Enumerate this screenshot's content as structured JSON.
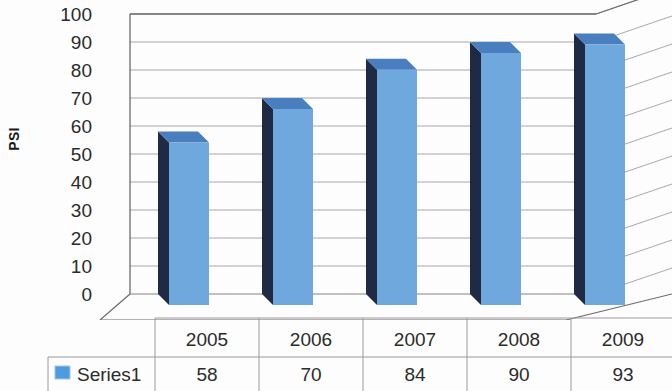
{
  "chart_data": {
    "type": "bar",
    "title": "",
    "subtitle": "",
    "xlabel": "",
    "ylabel": "PSI",
    "categories": [
      "2005",
      "2006",
      "2007",
      "2008",
      "2009"
    ],
    "series": [
      {
        "name": "Series1",
        "values": [
          58,
          70,
          84,
          90,
          93
        ]
      }
    ],
    "values": [
      58,
      70,
      84,
      90,
      93
    ],
    "ylim": [
      0,
      100
    ],
    "ytick_values": [
      100,
      90,
      80,
      70,
      60,
      50,
      40,
      30,
      20,
      10,
      0
    ],
    "ytick_labels": [
      "100",
      "90",
      "80",
      "70",
      "60",
      "50",
      "40",
      "30",
      "20",
      "10",
      "0"
    ],
    "grid": true,
    "grid_axis": "y",
    "legend_position": "bottom-table",
    "render_style": "3d-column",
    "colors": {
      "bar_front": "#6FA8DC",
      "bar_side": "#1F2A44",
      "bar_top": "#4A7FBF",
      "gridline": "#808080",
      "axis": "#6b6b6b",
      "table_border": "#9a9a9a",
      "text": "#2b2b2b",
      "legend_swatch": "#4F9BE0"
    }
  },
  "data_table": {
    "legend_swatch_name": "series-color-swatch",
    "row_header_label": "Series1",
    "column_headers": [
      "2005",
      "2006",
      "2007",
      "2008",
      "2009"
    ],
    "rows": [
      {
        "label": "Series1",
        "cells": [
          "58",
          "70",
          "84",
          "90",
          "93"
        ]
      }
    ]
  },
  "axis": {
    "y_title": "PSI",
    "y_ticks": [
      "100",
      "90",
      "80",
      "70",
      "60",
      "50",
      "40",
      "30",
      "20",
      "10",
      "0"
    ]
  }
}
